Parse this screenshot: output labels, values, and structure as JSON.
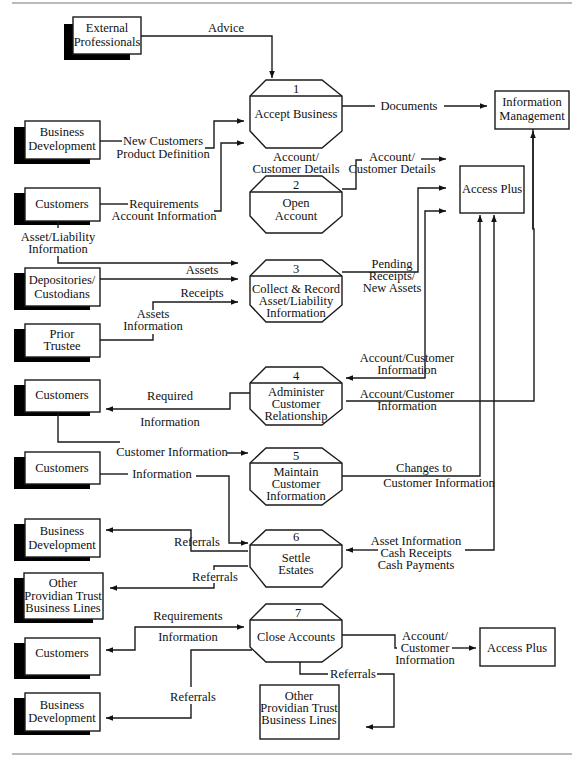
{
  "diagram": {
    "external_entities": {
      "external_professionals": [
        "External",
        "Professionals"
      ],
      "business_development_1": [
        "Business",
        "Development"
      ],
      "customers_1": [
        "Customers"
      ],
      "depositories": [
        "Depositories/",
        "Custodians"
      ],
      "prior_trustee": [
        "Prior",
        "Trustee"
      ],
      "customers_2": [
        "Customers"
      ],
      "customers_3": [
        "Customers"
      ],
      "business_development_2": [
        "Business",
        "Development"
      ],
      "other_providian_1": [
        "Other",
        "Providian Trust",
        "Business Lines"
      ],
      "customers_4": [
        "Customers"
      ],
      "business_development_3": [
        "Business",
        "Development"
      ]
    },
    "data_stores": {
      "information_management": [
        "Information",
        "Management"
      ],
      "access_plus_1": [
        "Access Plus"
      ],
      "access_plus_2": [
        "Access Plus"
      ],
      "other_providian_2": [
        "Other",
        "Providian Trust",
        "Business Lines"
      ]
    },
    "processes": [
      {
        "number": "1",
        "label": [
          "Accept Business"
        ]
      },
      {
        "number": "2",
        "label": [
          "Open",
          "Account"
        ]
      },
      {
        "number": "3",
        "label": [
          "Collect & Record",
          "Asset/Liability",
          "Information"
        ]
      },
      {
        "number": "4",
        "label": [
          "Administer",
          "Customer",
          "Relationship"
        ]
      },
      {
        "number": "5",
        "label": [
          "Maintain",
          "Customer",
          "Information"
        ]
      },
      {
        "number": "6",
        "label": [
          "Settle",
          "Estates"
        ]
      },
      {
        "number": "7",
        "label": [
          "Close Accounts"
        ]
      }
    ],
    "flows": {
      "advice": "Advice",
      "documents": "Documents",
      "new_customers": [
        "New Customers",
        "Product Definition"
      ],
      "requirements_account": [
        "Requirements",
        "Account Information"
      ],
      "account_customer_details_1": [
        "Account/",
        "Customer Details"
      ],
      "account_customer_details_2": [
        "Account/",
        "Customer Details"
      ],
      "asset_liability_info": [
        "Asset/Liability",
        "Information"
      ],
      "assets": "Assets",
      "receipts": "Receipts",
      "assets_information": [
        "Assets",
        "Information"
      ],
      "pending_receipts": [
        "Pending",
        "Receipts/",
        "New Assets"
      ],
      "account_customer_info_1": [
        "Account/Customer",
        "Information"
      ],
      "account_customer_info_2": [
        "Account/Customer",
        "Information"
      ],
      "required_information": [
        "Required",
        "Information"
      ],
      "customer_information": "Customer Information",
      "information": "Information",
      "changes_to_customer_info": [
        "Changes to",
        "Customer Information"
      ],
      "referrals_6a": "Referrals",
      "referrals_6b": "Referrals",
      "asset_cash": [
        "Asset Information",
        "Cash Receipts",
        "Cash Payments"
      ],
      "requirements_7": "Requirements",
      "information_7": "Information",
      "referrals_7a": "Referrals",
      "referrals_7b": "Referrals",
      "account_customer_info_7": [
        "Account/",
        "Customer",
        "Information"
      ]
    }
  }
}
